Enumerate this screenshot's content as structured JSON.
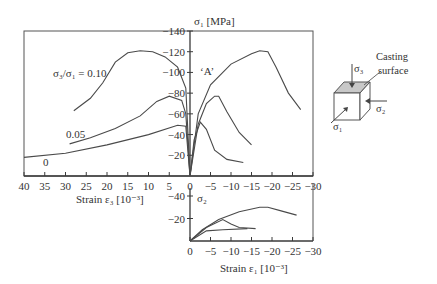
{
  "chart_data": [
    {
      "name": "main",
      "type": "line",
      "title": "",
      "ylabel": "σ1 [MPa]",
      "xlabel_left": "Strain ε3 [10^-3]",
      "x_ticks_left": [
        "40",
        "35",
        "30",
        "25",
        "20",
        "15",
        "10",
        "5",
        "0"
      ],
      "x_ticks_right": [
        "−5",
        "−10",
        "−15",
        "−20",
        "−25",
        "−30"
      ],
      "y_ticks": [
        "−20",
        "−40",
        "−60",
        "−80",
        "−100",
        "−120",
        "−140"
      ],
      "xlim": [
        40,
        -30
      ],
      "ylim": [
        0,
        -140
      ],
      "annotation": "‘A’",
      "series": [
        {
          "name": "σ3/σ1 = 0.10",
          "side": "ε3",
          "points": [
            [
              28,
              -63
            ],
            [
              24,
              -75
            ],
            [
              21,
              -90
            ],
            [
              18,
              -110
            ],
            [
              15,
              -119
            ],
            [
              12,
              -121
            ],
            [
              9,
              -120
            ],
            [
              6,
              -115
            ],
            [
              3,
              -105
            ],
            [
              1,
              -85
            ],
            [
              0,
              0
            ]
          ]
        },
        {
          "name": "0.05",
          "side": "ε3",
          "points": [
            [
              29,
              -31
            ],
            [
              24,
              -37
            ],
            [
              18,
              -46
            ],
            [
              12,
              -58
            ],
            [
              8,
              -72
            ],
            [
              5,
              -77
            ],
            [
              2,
              -73
            ],
            [
              1,
              -60
            ],
            [
              0,
              0
            ]
          ]
        },
        {
          "name": "0",
          "side": "ε3",
          "points": [
            [
              40,
              -18
            ],
            [
              30,
              -22
            ],
            [
              20,
              -30
            ],
            [
              10,
              -40
            ],
            [
              3,
              -49
            ],
            [
              1,
              -48
            ],
            [
              0,
              0
            ]
          ]
        },
        {
          "name": "0.10 (ε1)",
          "side": "ε1",
          "points": [
            [
              0,
              0
            ],
            [
              -2,
              -60
            ],
            [
              -5,
              -88
            ],
            [
              -10,
              -108
            ],
            [
              -15,
              -118
            ],
            [
              -17,
              -121
            ],
            [
              -19,
              -120
            ],
            [
              -21,
              -105
            ],
            [
              -24,
              -80
            ],
            [
              -27,
              -64
            ]
          ]
        },
        {
          "name": "0.05 (ε1)",
          "side": "ε1",
          "points": [
            [
              0,
              0
            ],
            [
              -2,
              -50
            ],
            [
              -4,
              -70
            ],
            [
              -6,
              -77
            ],
            [
              -7,
              -77
            ],
            [
              -9,
              -62
            ],
            [
              -12,
              -42
            ],
            [
              -15,
              -30
            ]
          ]
        },
        {
          "name": "0 (ε1)",
          "side": "ε1",
          "points": [
            [
              0,
              0
            ],
            [
              -1,
              -35
            ],
            [
              -2.5,
              -52
            ],
            [
              -4,
              -45
            ],
            [
              -6,
              -25
            ],
            [
              -9,
              -16
            ],
            [
              -13,
              -13
            ]
          ]
        }
      ],
      "legend_labels": [
        "σ3/σ1 = 0.10",
        "0.05",
        "0"
      ]
    },
    {
      "name": "lower",
      "type": "line",
      "ylabel": "σ2",
      "xlabel": "Strain ε1 [10^-3]",
      "x_ticks": [
        "0",
        "−5",
        "−10",
        "−15",
        "−20",
        "−25",
        "−30"
      ],
      "y_ticks": [
        "−20",
        "−40"
      ],
      "xlim": [
        0,
        -30
      ],
      "ylim": [
        0,
        -45
      ],
      "series": [
        {
          "name": "0.10",
          "points": [
            [
              0,
              0
            ],
            [
              -3,
              -10
            ],
            [
              -7,
              -19
            ],
            [
              -12,
              -26
            ],
            [
              -17,
              -30
            ],
            [
              -19,
              -30
            ],
            [
              -22,
              -27
            ],
            [
              -26,
              -23
            ]
          ]
        },
        {
          "name": "0.05",
          "points": [
            [
              0,
              0
            ],
            [
              -4,
              -12
            ],
            [
              -8,
              -19
            ],
            [
              -10,
              -15
            ],
            [
              -12,
              -12
            ],
            [
              -16,
              -11
            ]
          ]
        },
        {
          "name": "0",
          "points": [
            [
              0,
              0
            ],
            [
              -4,
              -9
            ],
            [
              -8,
              -10
            ],
            [
              -14,
              -11
            ]
          ]
        }
      ]
    }
  ],
  "labels": {
    "sigma1_axis": "σ₁ [MPa]",
    "sigma2_axis": "σ₂",
    "ratio_010": "σ₃/σ₁ = 0.10",
    "ratio_005": "0.05",
    "ratio_0": "0",
    "annotation_A": "‘A’",
    "strain3": "Strain ε₃ [10⁻³]",
    "strain1": "Strain ε₁ [10⁻³]"
  },
  "diagram": {
    "sigma3": "σ₃",
    "sigma2": "σ₂",
    "sigma1": "σ₁",
    "casting_line1": "Casting",
    "casting_line2": "surface",
    "top_face_color": "#c8c8c8"
  }
}
